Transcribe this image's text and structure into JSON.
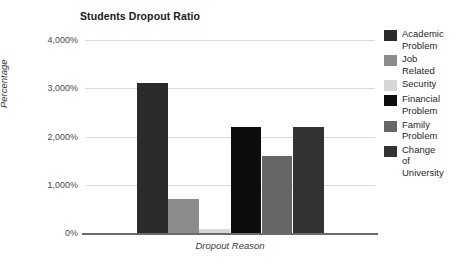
{
  "chart_data": {
    "type": "bar",
    "title": "Students Dropout Ratio",
    "xlabel": "Dropout Reason",
    "ylabel": "Percentage",
    "categories": [
      "Academic Problem",
      "Job Related",
      "Security",
      "Financial Problem",
      "Family Problem",
      "Change of University"
    ],
    "values": [
      3100,
      700,
      90,
      2200,
      1600,
      2200
    ],
    "value_unit": "%",
    "ylim": [
      0,
      4000
    ],
    "ytick_values": [
      0,
      1000,
      2000,
      3000,
      4000
    ],
    "ytick_labels": [
      "0%",
      "1,000%",
      "2,000%",
      "3,000%",
      "4,000%"
    ],
    "grid": true,
    "legend_position": "right",
    "series_colors": [
      "#2b2b2b",
      "#8c8c8c",
      "#d6d6d6",
      "#0d0d0d",
      "#666666",
      "#333333"
    ],
    "legend": [
      {
        "label": "Academic\nProblem",
        "color": "#2b2b2b"
      },
      {
        "label": "Job\nRelated",
        "color": "#8c8c8c"
      },
      {
        "label": "Security",
        "color": "#d6d6d6"
      },
      {
        "label": "Financial\nProblem",
        "color": "#0d0d0d"
      },
      {
        "label": "Family\nProblem",
        "color": "#666666"
      },
      {
        "label": "Change\nof\nUniversity",
        "color": "#333333"
      }
    ]
  }
}
